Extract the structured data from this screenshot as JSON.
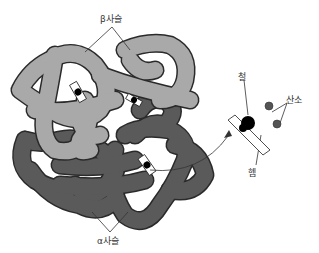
{
  "diagram": {
    "labels": {
      "beta_chain": "β사슬",
      "alpha_chain": "α사슬",
      "iron": "철",
      "heme": "헴",
      "oxygen": "산소"
    },
    "colors": {
      "beta_chain": "#a9a9a9",
      "alpha_chain": "#5a5a5a",
      "outline": "#2a2a2a",
      "iron": "#000000",
      "oxygen": "#555555",
      "background": "#ffffff"
    }
  }
}
